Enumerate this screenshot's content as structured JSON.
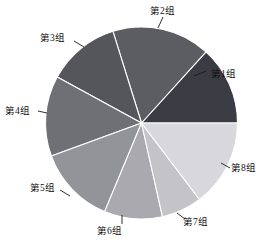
{
  "chart_data": {
    "type": "pie",
    "title": "",
    "subtitle": "",
    "xlabel": "",
    "ylabel": "",
    "grid": false,
    "legend_position": "none",
    "label_style": "outside-with-leader-lines",
    "start_angle_deg": 0,
    "direction": "counterclockwise",
    "categories": [
      "第1组",
      "第2组",
      "第3组",
      "第4组",
      "第5组",
      "第6组",
      "第7组",
      "第8组"
    ],
    "values": [
      13.3,
      16.5,
      12.2,
      13.5,
      13.1,
      9.8,
      6.8,
      14.7
    ],
    "units": "percent",
    "slices": [
      {
        "label": "第1组",
        "value": 13.3,
        "start_deg": 0.0,
        "end_deg": 47.8,
        "color": "#3b3b43",
        "label_x": 211,
        "label_y": 69,
        "leader": [
          194,
          76,
          206,
          71
        ]
      },
      {
        "label": "第2组",
        "value": 16.5,
        "start_deg": 47.8,
        "end_deg": 107.3,
        "color": "#5c5c63",
        "label_x": 150,
        "label_y": 6,
        "leader": [
          158,
          28,
          163,
          17
        ]
      },
      {
        "label": "第3组",
        "value": 12.2,
        "start_deg": 107.3,
        "end_deg": 151.4,
        "color": "#55555c",
        "label_x": 40,
        "label_y": 33,
        "leader": [
          84,
          47,
          74,
          41
        ]
      },
      {
        "label": "第4组",
        "value": 13.5,
        "start_deg": 151.4,
        "end_deg": 200.1,
        "color": "#6f6f76",
        "label_x": 5,
        "label_y": 106,
        "leader": [
          47,
          113,
          38,
          111
        ]
      },
      {
        "label": "第5组",
        "value": 13.1,
        "start_deg": 200.1,
        "end_deg": 247.4,
        "color": "#93939a",
        "label_x": 30,
        "label_y": 183,
        "leader": [
          70,
          196,
          60,
          190
        ]
      },
      {
        "label": "第6组",
        "value": 9.8,
        "start_deg": 247.4,
        "end_deg": 282.6,
        "color": "#a9a9af",
        "label_x": 97,
        "label_y": 226,
        "leader": [
          122,
          215,
          122,
          224
        ]
      },
      {
        "label": "第7组",
        "value": 6.8,
        "start_deg": 282.6,
        "end_deg": 307.2,
        "color": "#c3c3c8",
        "label_x": 183,
        "label_y": 217,
        "leader": [
          177,
          213,
          185,
          219
        ]
      },
      {
        "label": "第8组",
        "value": 14.7,
        "start_deg": 307.2,
        "end_deg": 360.0,
        "color": "#d8d8dc",
        "label_x": 231,
        "label_y": 163,
        "leader": [
          221,
          163,
          230,
          168
        ]
      }
    ],
    "geometry": {
      "center_x": 141.5,
      "center_y": 123,
      "radius": 96
    }
  }
}
